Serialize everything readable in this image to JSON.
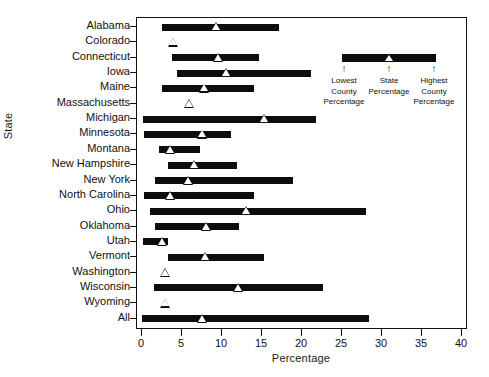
{
  "chart_data": {
    "type": "bar",
    "orientation": "horizontal",
    "title": "",
    "xlabel": "Percentage",
    "ylabel": "State",
    "xlim": [
      0,
      40
    ],
    "xticks": [
      0,
      5,
      10,
      15,
      20,
      25,
      30,
      35,
      40
    ],
    "grid": false,
    "categories": [
      "Alabama",
      "Colorado",
      "Connecticut",
      "Iowa",
      "Maine",
      "Massachusetts",
      "Michigan",
      "Minnesota",
      "Montana",
      "New Hampshire",
      "New York",
      "North Carolina",
      "Ohio",
      "Oklahoma",
      "Utah",
      "Vermont",
      "Washington",
      "Wisconsin",
      "Wyoming",
      "All"
    ],
    "series": [
      {
        "name": "Lowest County Percentage",
        "values": [
          2.5,
          3.9,
          3.8,
          4.4,
          2.5,
          5.9,
          0.1,
          0.3,
          2.1,
          3.3,
          1.6,
          0.3,
          1.0,
          1.6,
          0.1,
          3.3,
          2.9,
          1.5,
          2.9,
          0.0
        ]
      },
      {
        "name": "State Percentage",
        "values": [
          9.3,
          3.9,
          9.5,
          10.6,
          7.8,
          5.9,
          15.3,
          7.6,
          3.6,
          6.5,
          5.8,
          3.5,
          13.0,
          8.1,
          2.5,
          7.9,
          2.9,
          12.1,
          2.9,
          7.6
        ]
      },
      {
        "name": "Highest County Percentage",
        "values": [
          17.1,
          3.9,
          14.6,
          21.1,
          14.0,
          5.9,
          21.8,
          11.1,
          7.3,
          11.9,
          18.9,
          14.0,
          28.0,
          12.1,
          3.2,
          15.3,
          2.9,
          22.6,
          2.9,
          28.4
        ]
      }
    ],
    "colors": {
      "bar": "#0d0d0d",
      "marker": "#ffffff",
      "marker_edge": "#111111",
      "axis": "#111111"
    }
  },
  "legend": {
    "low_arrow": "↑",
    "state_arrow": "↑",
    "high_arrow": "↑",
    "low_caption": "Lowest\nCounty\nPercentage",
    "state_caption": "State\nPercentage",
    "high_caption": "Highest\nCounty\nPercentage"
  }
}
